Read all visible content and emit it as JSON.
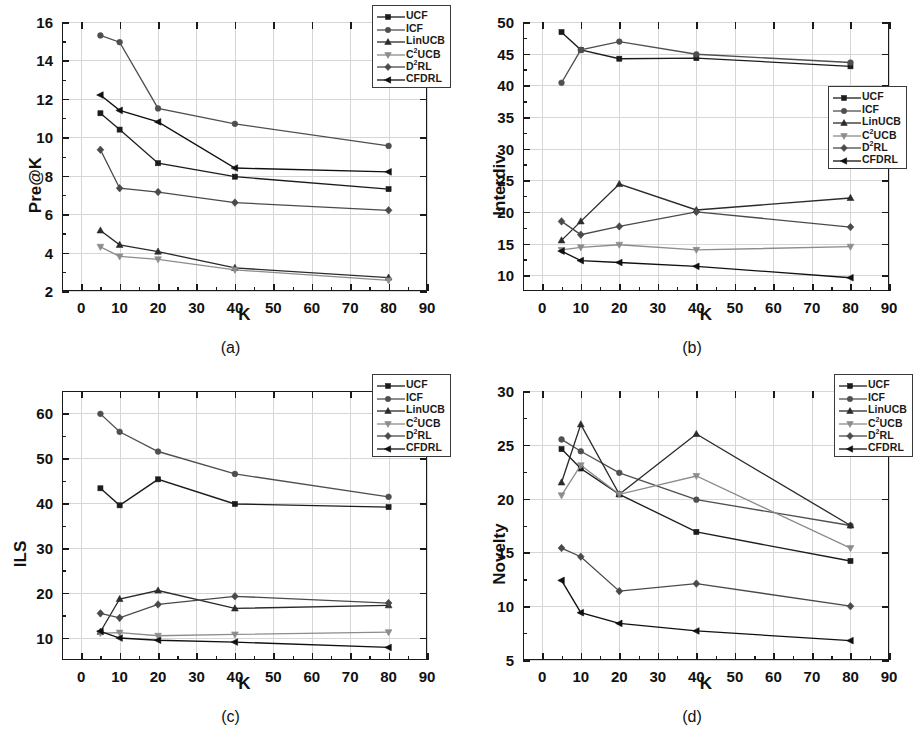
{
  "figure": {
    "xlabel": "K",
    "x_ticks": [
      0,
      10,
      20,
      30,
      40,
      50,
      60,
      70,
      80,
      90
    ],
    "series_names": [
      "UCF",
      "ICF",
      "LinUCB",
      "C²UCB",
      "D²RL",
      "CFDRL"
    ],
    "series_markers": [
      "square",
      "circle",
      "triangle-up",
      "triangle-down",
      "diamond",
      "triangle-left"
    ],
    "series_colors": [
      "#1c1c1c",
      "#4f4f4f",
      "#2b2b2b",
      "#8c8c8c",
      "#4a4a4a",
      "#101010"
    ],
    "legend_labels": [
      {
        "main": "UCF",
        "sup": ""
      },
      {
        "main": "ICF",
        "sup": ""
      },
      {
        "main": "LinUCB",
        "sup": ""
      },
      {
        "main": "C",
        "sup": "2",
        "tail": "UCB"
      },
      {
        "main": "D",
        "sup": "2",
        "tail": "RL"
      },
      {
        "main": "CFDRL",
        "sup": ""
      }
    ]
  },
  "chart_data": [
    {
      "type": "line",
      "panel": "a",
      "caption": "(a)",
      "title": "",
      "xlabel": "K",
      "ylabel": "Pre@K",
      "x": [
        5,
        10,
        20,
        40,
        80
      ],
      "xlim": [
        -5,
        90
      ],
      "ylim": [
        2,
        16
      ],
      "y_ticks": [
        2,
        4,
        6,
        8,
        10,
        12,
        14,
        16
      ],
      "grid": true,
      "legend_position": "top-right",
      "series": [
        {
          "name": "UCF",
          "values": [
            11.25,
            10.4,
            8.65,
            7.95,
            7.3
          ]
        },
        {
          "name": "ICF",
          "values": [
            15.3,
            14.95,
            11.5,
            10.7,
            9.55
          ]
        },
        {
          "name": "LinUCB",
          "values": [
            5.15,
            4.4,
            4.05,
            3.2,
            2.7
          ]
        },
        {
          "name": "C²UCB",
          "values": [
            4.3,
            3.8,
            3.65,
            3.1,
            2.55
          ]
        },
        {
          "name": "D²RL",
          "values": [
            9.35,
            7.35,
            7.15,
            6.6,
            6.2
          ]
        },
        {
          "name": "CFDRL",
          "values": [
            12.2,
            11.4,
            10.8,
            8.4,
            8.2
          ]
        }
      ]
    },
    {
      "type": "line",
      "panel": "b",
      "caption": "(b)",
      "title": "",
      "xlabel": "K",
      "ylabel": "Interdiv",
      "x": [
        5,
        10,
        20,
        40,
        80
      ],
      "xlim": [
        -5,
        90
      ],
      "ylim": [
        7.5,
        50
      ],
      "y_ticks": [
        10,
        15,
        20,
        25,
        30,
        35,
        40,
        45,
        50
      ],
      "grid": true,
      "legend_position": "right-middle",
      "series": [
        {
          "name": "UCF",
          "values": [
            48.4,
            45.6,
            44.2,
            44.3,
            43.0
          ]
        },
        {
          "name": "ICF",
          "values": [
            40.4,
            45.6,
            46.9,
            44.9,
            43.6
          ]
        },
        {
          "name": "LinUCB",
          "values": [
            15.5,
            18.5,
            24.4,
            20.3,
            22.2
          ]
        },
        {
          "name": "C²UCB",
          "values": [
            14.0,
            14.4,
            14.8,
            14.0,
            14.5
          ]
        },
        {
          "name": "D²RL",
          "values": [
            18.5,
            16.4,
            17.7,
            20.0,
            17.6
          ]
        },
        {
          "name": "CFDRL",
          "values": [
            13.8,
            12.3,
            12.0,
            11.4,
            9.6
          ]
        }
      ]
    },
    {
      "type": "line",
      "panel": "c",
      "caption": "(c)",
      "title": "",
      "xlabel": "K",
      "ylabel": "ILS",
      "x": [
        5,
        10,
        20,
        40,
        80
      ],
      "xlim": [
        -5,
        90
      ],
      "ylim": [
        5,
        65
      ],
      "y_ticks": [
        10,
        20,
        30,
        40,
        50,
        60
      ],
      "grid": true,
      "legend_position": "top-right",
      "series": [
        {
          "name": "UCF",
          "values": [
            43.3,
            39.5,
            45.3,
            39.8,
            39.1
          ]
        },
        {
          "name": "ICF",
          "values": [
            59.9,
            55.9,
            51.5,
            46.5,
            41.4
          ]
        },
        {
          "name": "LinUCB",
          "values": [
            11.3,
            18.6,
            20.5,
            16.5,
            17.2
          ]
        },
        {
          "name": "C²UCB",
          "values": [
            11.0,
            11.1,
            10.4,
            10.7,
            11.2
          ]
        },
        {
          "name": "D²RL",
          "values": [
            15.4,
            14.4,
            17.4,
            19.2,
            17.7
          ]
        },
        {
          "name": "CFDRL",
          "values": [
            11.4,
            9.9,
            9.4,
            9.0,
            7.8
          ]
        }
      ]
    },
    {
      "type": "line",
      "panel": "d",
      "caption": "(d)",
      "title": "",
      "xlabel": "K",
      "ylabel": "Novelty",
      "x": [
        5,
        10,
        20,
        40,
        80
      ],
      "xlim": [
        -5,
        90
      ],
      "ylim": [
        5,
        30
      ],
      "y_ticks": [
        5,
        10,
        15,
        20,
        25,
        30
      ],
      "grid": true,
      "legend_position": "top-right",
      "series": [
        {
          "name": "UCF",
          "values": [
            24.6,
            22.8,
            20.4,
            16.9,
            14.2
          ]
        },
        {
          "name": "ICF",
          "values": [
            25.5,
            24.4,
            22.4,
            19.9,
            17.5
          ]
        },
        {
          "name": "LinUCB",
          "values": [
            21.5,
            26.9,
            20.4,
            26.0,
            17.5
          ]
        },
        {
          "name": "C²UCB",
          "values": [
            20.3,
            23.1,
            20.4,
            22.1,
            15.4
          ]
        },
        {
          "name": "D²RL",
          "values": [
            15.4,
            14.6,
            11.4,
            12.1,
            10.0
          ]
        },
        {
          "name": "CFDRL",
          "values": [
            12.4,
            9.4,
            8.4,
            7.7,
            6.8
          ]
        }
      ]
    }
  ]
}
